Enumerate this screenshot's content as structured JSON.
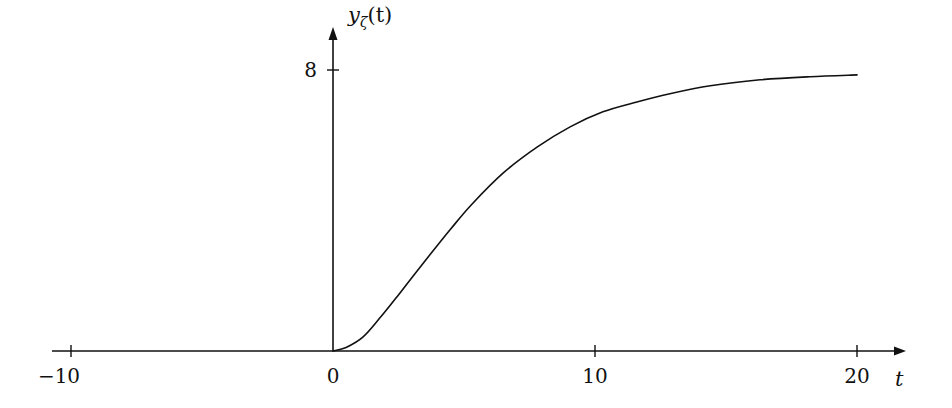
{
  "chart_data": {
    "type": "line",
    "title": "",
    "xlabel": "t",
    "ylabel": "y_ζ(t)",
    "ylabel_parts": {
      "main": "y",
      "sub": "ζ",
      "paren": "(t)"
    },
    "xlim": [
      -11,
      21.5
    ],
    "ylim": [
      0,
      9
    ],
    "x_ticks": [
      -10,
      0,
      10,
      20
    ],
    "x_tick_labels": [
      "−10",
      "0",
      "10",
      "20"
    ],
    "y_ticks": [
      8
    ],
    "y_tick_labels": [
      "8"
    ],
    "grid": false,
    "legend": null,
    "series": [
      {
        "name": "y_ζ(t)",
        "color": "#111111",
        "x": [
          -11,
          0,
          0.5,
          1.15,
          1.8,
          2.44,
          3.0,
          3.7,
          4.5,
          5.3,
          6.5,
          7.8,
          9.05,
          10.3,
          11.6,
          12.9,
          14.4,
          16.3,
          18.2,
          20.0
        ],
        "y": [
          0,
          0,
          0.1,
          0.4,
          0.95,
          1.54,
          2.08,
          2.74,
          3.48,
          4.18,
          5.07,
          5.81,
          6.38,
          6.81,
          7.09,
          7.33,
          7.55,
          7.72,
          7.81,
          7.86
        ]
      }
    ],
    "asymptote": 8
  }
}
